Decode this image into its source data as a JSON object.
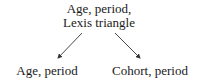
{
  "diagram": {
    "nodes": {
      "top": {
        "line1": "Age, period,",
        "line2": "Lexis triangle"
      },
      "left": {
        "label": "Age, period"
      },
      "right": {
        "label": "Cohort, period"
      }
    },
    "edges": [
      {
        "from": "top",
        "to": "left",
        "type": "arrow"
      },
      {
        "from": "top",
        "to": "right",
        "type": "arrow"
      }
    ],
    "colors": {
      "text": "#1a1a1a",
      "arrow": "#333333",
      "background": "#ffffff"
    }
  }
}
